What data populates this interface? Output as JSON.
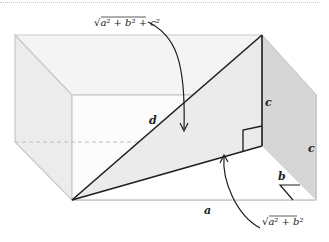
{
  "diagram": {
    "type": "3d-rectangular-box-diagonal",
    "labels": {
      "space_diagonal": "d",
      "space_diagonal_formula_prefix": "√",
      "space_diagonal_formula": "a² + b² + c²",
      "base_diagonal_formula_prefix": "√",
      "base_diagonal_formula": "a² + b²",
      "length": "a",
      "width": "b",
      "height_inner": "c",
      "height_outer": "c"
    },
    "colors": {
      "box_edge": "#c9c9c9",
      "box_face_light": "#f3f3f3",
      "box_face_side": "#e6e6e6",
      "right_face": "#d4d4d4",
      "triangle_fill": "#ececec",
      "line_dark": "#1e1e1e"
    }
  }
}
